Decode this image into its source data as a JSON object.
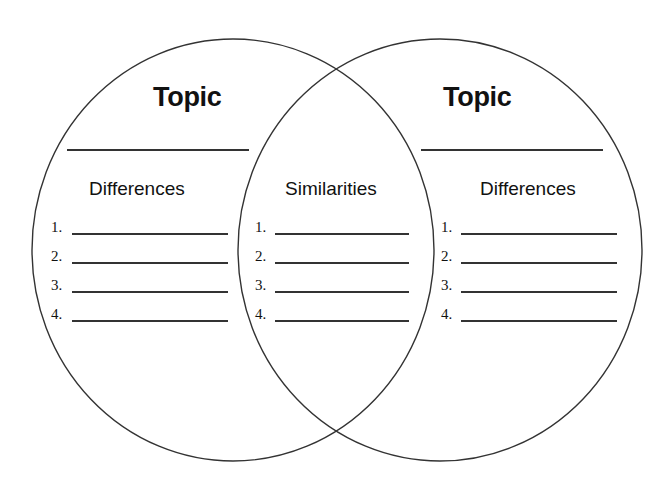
{
  "diagram": {
    "type": "venn",
    "circles": [
      {
        "id": "left",
        "cx": 233,
        "cy": 250,
        "rx": 201,
        "ry": 211
      },
      {
        "id": "right",
        "cx": 440,
        "cy": 250,
        "rx": 202,
        "ry": 211
      }
    ],
    "stroke_color": "#333333",
    "background": "#ffffff"
  },
  "left": {
    "topic": "Topic",
    "heading": "Differences",
    "items": [
      "1.",
      "2.",
      "3.",
      "4."
    ]
  },
  "middle": {
    "heading": "Similarities",
    "items": [
      "1.",
      "2.",
      "3.",
      "4."
    ]
  },
  "right": {
    "topic": "Topic",
    "heading": "Differences",
    "items": [
      "1.",
      "2.",
      "3.",
      "4."
    ]
  }
}
